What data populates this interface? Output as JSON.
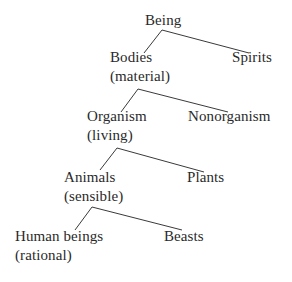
{
  "diagram": {
    "type": "tree",
    "title": "",
    "nodes": {
      "being": {
        "label": "Being"
      },
      "bodies": {
        "label": "Bodies",
        "qualifier": "(material)"
      },
      "spirits": {
        "label": "Spirits"
      },
      "organism": {
        "label": "Organism",
        "qualifier": "(living)"
      },
      "nonorganism": {
        "label": "Nonorganism"
      },
      "animals": {
        "label": "Animals",
        "qualifier": "(sensible)"
      },
      "plants": {
        "label": "Plants"
      },
      "human_beings": {
        "label": "Human beings",
        "qualifier": "(rational)"
      },
      "beasts": {
        "label": "Beasts"
      }
    },
    "edges": [
      {
        "from": "Being",
        "to": "Bodies"
      },
      {
        "from": "Being",
        "to": "Spirits"
      },
      {
        "from": "Bodies",
        "to": "Organism"
      },
      {
        "from": "Bodies",
        "to": "Nonorganism"
      },
      {
        "from": "Organism",
        "to": "Animals"
      },
      {
        "from": "Organism",
        "to": "Plants"
      },
      {
        "from": "Animals",
        "to": "Human beings"
      },
      {
        "from": "Animals",
        "to": "Beasts"
      }
    ],
    "colors": {
      "background": "#ffffff",
      "text": "#2a2a2a",
      "line": "#3a3a3a"
    }
  }
}
